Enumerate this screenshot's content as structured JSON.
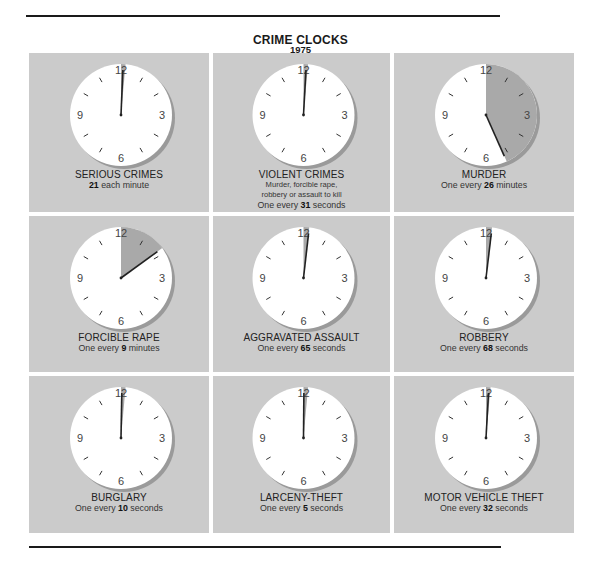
{
  "header": {
    "title": "CRIME CLOCKS",
    "year": "1975"
  },
  "colors": {
    "panel": "#cbcbcb",
    "face": "#ffffff",
    "sector": "#a9a9a9",
    "hand": "#222222",
    "shadow": "#9a9a9a"
  },
  "clock_numerals": [
    "12",
    "3",
    "6",
    "9"
  ],
  "cells": [
    {
      "title": "SERIOUS CRIMES",
      "prefix": "",
      "value": "21",
      "suffix": " each minute",
      "desc": [],
      "sector_minutes": 0.4
    },
    {
      "title": "VIOLENT CRIMES",
      "prefix": "One every ",
      "value": "31",
      "suffix": " seconds",
      "desc": [
        "Murder, forcible rape,",
        "robbery or assault to kill"
      ],
      "sector_minutes": 0.52
    },
    {
      "title": "MURDER",
      "prefix": "One every ",
      "value": "26",
      "suffix": " minutes",
      "desc": [],
      "sector_minutes": 26
    },
    {
      "title": "FORCIBLE RAPE",
      "prefix": "One every ",
      "value": "9",
      "suffix": " minutes",
      "desc": [],
      "sector_minutes": 9
    },
    {
      "title": "AGGRAVATED ASSAULT",
      "prefix": "One every ",
      "value": "65",
      "suffix": " seconds",
      "desc": [],
      "sector_minutes": 1.08
    },
    {
      "title": "ROBBERY",
      "prefix": "One every ",
      "value": "68",
      "suffix": " seconds",
      "desc": [],
      "sector_minutes": 1.13
    },
    {
      "title": "BURGLARY",
      "prefix": "One every ",
      "value": "10",
      "suffix": " seconds",
      "desc": [],
      "sector_minutes": 0.17
    },
    {
      "title": "LARCENY-THEFT",
      "prefix": "One every ",
      "value": "5",
      "suffix": " seconds",
      "desc": [],
      "sector_minutes": 0.08
    },
    {
      "title": "MOTOR VEHICLE THEFT",
      "prefix": "One every ",
      "value": "32",
      "suffix": " seconds",
      "desc": [],
      "sector_minutes": 0.53
    }
  ],
  "chart_data": {
    "type": "pie",
    "title": "CRIME CLOCKS",
    "subtitle": "1975",
    "layout": "3x3 grid of clock faces; shaded sector from 12 o'clock to minute hand shows interval between offenses (in minutes of a 60-minute dial)",
    "categories": [
      "Serious Crimes",
      "Violent Crimes",
      "Murder",
      "Forcible Rape",
      "Aggravated Assault",
      "Robbery",
      "Burglary",
      "Larceny-Theft",
      "Motor Vehicle Theft"
    ],
    "series": [
      {
        "name": "Interval",
        "values": [
          "21 each minute",
          "31 seconds",
          "26 minutes",
          "9 minutes",
          "65 seconds",
          "68 seconds",
          "10 seconds",
          "5 seconds",
          "32 seconds"
        ]
      },
      {
        "name": "Interval (seconds)",
        "values": [
          2.86,
          31,
          1560,
          540,
          65,
          68,
          10,
          5,
          32
        ]
      },
      {
        "name": "Hand position (minutes on dial)",
        "values": [
          0.05,
          0.52,
          26,
          9,
          1.08,
          1.13,
          0.17,
          0.08,
          0.53
        ]
      }
    ],
    "annotations": [
      "Violent crimes: Murder, forcible rape, robbery or assault to kill"
    ],
    "grid": false,
    "legend": "none"
  }
}
